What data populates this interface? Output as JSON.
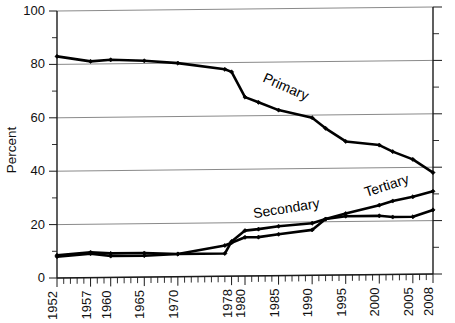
{
  "figure": {
    "background_color": "#ffffff",
    "line_color": "#000000",
    "grid_color": "#8a8a8a",
    "axis_color": "#1a1a1a"
  },
  "axes": {
    "ylabel": "Percent",
    "ytick_labels": [
      "0",
      "20",
      "40",
      "60",
      "80",
      "100"
    ],
    "xtick_labels": [
      "1952",
      "1957",
      "1960",
      "1965",
      "1970",
      "1978",
      "1980",
      "1985",
      "1990",
      "1995",
      "2000",
      "2005",
      "2008"
    ]
  },
  "series_labels": {
    "primary": "Primary",
    "secondary": "Secondary",
    "tertiary": "Tertiary"
  },
  "chart_data": {
    "type": "line",
    "title": "",
    "xlabel": "",
    "ylabel": "Percent",
    "xlim": [
      1952,
      2008
    ],
    "ylim": [
      0,
      100
    ],
    "yticks": [
      0,
      20,
      40,
      60,
      80,
      100
    ],
    "yminor_step": 10,
    "xticks": [
      1952,
      1957,
      1960,
      1965,
      1970,
      1978,
      1980,
      1985,
      1990,
      1995,
      2000,
      2005,
      2008
    ],
    "xminor_step": 1,
    "grid": "horizontal",
    "legend": "inline-labels",
    "series": [
      {
        "name": "Primary",
        "x": [
          1952,
          1957,
          1960,
          1965,
          1970,
          1977,
          1978,
          1980,
          1982,
          1985,
          1990,
          1992,
          1995,
          2000,
          2002,
          2005,
          2008
        ],
        "values": [
          83,
          81,
          81.5,
          81,
          80,
          77.5,
          76.5,
          67,
          65,
          62,
          59,
          55,
          50,
          48.5,
          46,
          43,
          38
        ]
      },
      {
        "name": "Secondary",
        "x": [
          1952,
          1957,
          1960,
          1965,
          1970,
          1977,
          1978,
          1980,
          1982,
          1985,
          1990,
          1992,
          1995,
          2000,
          2002,
          2005,
          2008
        ],
        "values": [
          8.5,
          9.5,
          9,
          9,
          8.5,
          8.5,
          13,
          17,
          17.5,
          18.5,
          19.5,
          21,
          22,
          22,
          21.5,
          21.5,
          24
        ]
      },
      {
        "name": "Tertiary",
        "x": [
          1952,
          1957,
          1960,
          1965,
          1970,
          1977,
          1978,
          1980,
          1982,
          1985,
          1990,
          1992,
          1995,
          2000,
          2002,
          2005,
          2008
        ],
        "values": [
          8,
          9,
          8,
          8,
          8.5,
          11.5,
          12.5,
          14.5,
          14.5,
          15.5,
          17,
          21,
          23,
          26,
          27.5,
          29,
          31
        ]
      }
    ]
  }
}
